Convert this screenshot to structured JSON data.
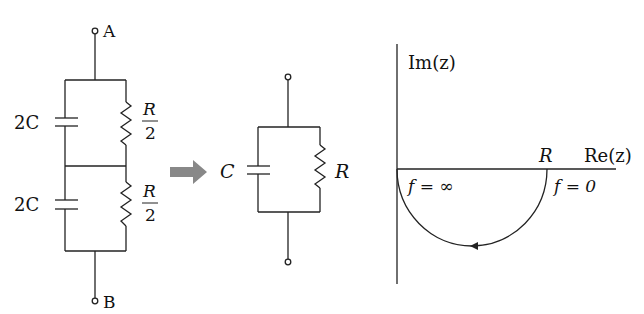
{
  "left_circuit": {
    "terminal_top": "A",
    "terminal_bottom": "B",
    "upper_capacitor": "2C",
    "lower_capacitor": "2C",
    "upper_resistor": {
      "num": "R",
      "den": "2"
    },
    "lower_resistor": {
      "num": "R",
      "den": "2"
    }
  },
  "arrow": {
    "color": "#888888"
  },
  "middle_circuit": {
    "capacitor": "C",
    "resistor": "R"
  },
  "plot": {
    "y_axis_label": "Im(z)",
    "x_axis_label": "Re(z)",
    "point_label": "R",
    "label_left": "f = ∞",
    "label_right": "f = 0"
  }
}
